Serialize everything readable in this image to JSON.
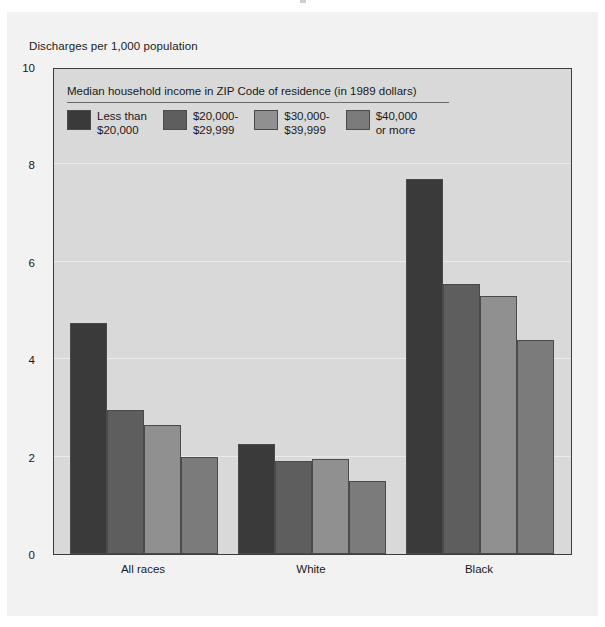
{
  "figure": {
    "ylabel": "Discharges per 1,000 population"
  },
  "legend": {
    "title": "Median household income in ZIP Code of residence (in 1989 dollars)",
    "items": [
      {
        "label_line1": "Less than",
        "label_line2": "$20,000",
        "color": "#3a3a3a"
      },
      {
        "label_line1": "$20,000-",
        "label_line2": "$29,999",
        "color": "#5e5e5e"
      },
      {
        "label_line1": "$30,000-",
        "label_line2": "$39,999",
        "color": "#909090"
      },
      {
        "label_line1": "$40,000",
        "label_line2": "or more",
        "color": "#7b7b7b"
      }
    ]
  },
  "chart_data": {
    "type": "bar",
    "title": "",
    "xlabel": "",
    "ylabel": "Discharges per 1,000 population",
    "ylim": [
      0,
      10
    ],
    "yticks": [
      0,
      2,
      4,
      6,
      8,
      10
    ],
    "grid": true,
    "legend_position": "inside-top-left",
    "categories": [
      "All races",
      "White",
      "Black"
    ],
    "series": [
      {
        "name": "Less than $20,000",
        "color": "#3a3a3a",
        "values": [
          4.75,
          2.25,
          7.7
        ]
      },
      {
        "name": "$20,000-$29,999",
        "color": "#5e5e5e",
        "values": [
          2.95,
          1.9,
          5.55
        ]
      },
      {
        "name": "$30,000-$39,999",
        "color": "#909090",
        "values": [
          2.65,
          1.95,
          5.3
        ]
      },
      {
        "name": "$40,000 or more",
        "color": "#7b7b7b",
        "values": [
          2.0,
          1.5,
          4.4
        ]
      }
    ]
  }
}
